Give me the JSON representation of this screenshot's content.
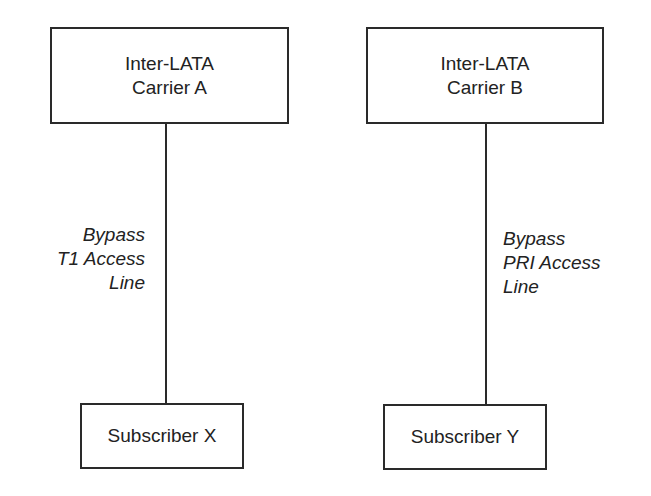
{
  "diagram": {
    "carriers": [
      {
        "id": "A",
        "lines": [
          "Inter-LATA",
          "Carrier A"
        ]
      },
      {
        "id": "B",
        "lines": [
          "Inter-LATA",
          "Carrier B"
        ]
      }
    ],
    "connections": [
      {
        "from": "Carrier A",
        "to": "Subscriber X",
        "label_lines": [
          "Bypass",
          "T1 Access",
          "Line"
        ]
      },
      {
        "from": "Carrier B",
        "to": "Subscriber Y",
        "label_lines": [
          "Bypass",
          "PRI Access",
          "Line"
        ]
      }
    ],
    "subscribers": [
      {
        "id": "X",
        "label": "Subscriber X"
      },
      {
        "id": "Y",
        "label": "Subscriber Y"
      }
    ]
  }
}
